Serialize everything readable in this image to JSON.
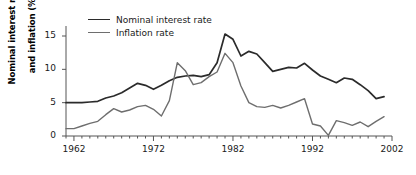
{
  "chart_data": {
    "type": "line",
    "title": "",
    "xlabel": "",
    "ylabel": "Nominal interest rate and inflation (%)",
    "ylabel_line1": "Nominal interest rate",
    "ylabel_line2": "and inflation (%)",
    "xlim": [
      1961,
      2002
    ],
    "ylim": [
      0,
      16.5
    ],
    "yticks": [
      0,
      5,
      10,
      15
    ],
    "ytick_labels": [
      "0",
      "5",
      "10",
      "15"
    ],
    "xticks": [
      1962,
      1972,
      1982,
      1992,
      2002
    ],
    "xtick_labels": [
      "1962",
      "1972",
      "1982",
      "1992",
      "2002"
    ],
    "minor_xticks_every": 1,
    "grid": false,
    "legend_position": "top-left-inside",
    "x": [
      1961,
      1962,
      1963,
      1964,
      1965,
      1966,
      1967,
      1968,
      1969,
      1970,
      1971,
      1972,
      1973,
      1974,
      1975,
      1976,
      1977,
      1978,
      1979,
      1980,
      1981,
      1982,
      1983,
      1984,
      1985,
      1986,
      1987,
      1988,
      1989,
      1990,
      1991,
      1992,
      1993,
      1994,
      1995,
      1996,
      1997,
      1998,
      1999,
      2000,
      2001
    ],
    "series": [
      {
        "name": "Nominal interest rate",
        "color": "#2b2b2b",
        "width": 1.7,
        "values": [
          5.0,
          5.0,
          5.0,
          5.1,
          5.2,
          5.7,
          6.0,
          6.5,
          7.2,
          7.9,
          7.6,
          7.0,
          7.6,
          8.3,
          8.8,
          9.0,
          9.1,
          8.9,
          9.2,
          11.0,
          15.3,
          14.5,
          12.0,
          12.7,
          12.3,
          11.0,
          9.7,
          10.0,
          10.3,
          10.2,
          10.9,
          9.9,
          9.0,
          8.5,
          8.0,
          8.7,
          8.5,
          7.7,
          6.8,
          5.6,
          5.9
        ]
      },
      {
        "name": "Inflation rate",
        "color": "#6e6e6e",
        "width": 1.4,
        "values": [
          1.1,
          1.1,
          1.5,
          1.9,
          2.2,
          3.2,
          4.1,
          3.6,
          3.9,
          4.4,
          4.6,
          4.0,
          3.0,
          5.3,
          11.0,
          9.8,
          7.7,
          8.0,
          8.9,
          9.6,
          12.4,
          11.0,
          7.5,
          5.0,
          4.4,
          4.3,
          4.6,
          4.2,
          4.6,
          5.1,
          5.6,
          1.8,
          1.5,
          0.1,
          2.3,
          2.0,
          1.6,
          2.1,
          1.4,
          2.2,
          2.9
        ]
      }
    ]
  },
  "legend": {
    "items": [
      {
        "label": "Nominal interest rate",
        "color": "#2b2b2b",
        "width": "1.8px"
      },
      {
        "label": "Inflation rate",
        "color": "#6e6e6e",
        "width": "1.5px"
      }
    ]
  }
}
